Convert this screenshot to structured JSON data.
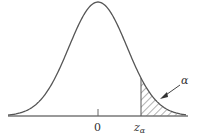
{
  "chart_data": {
    "type": "line",
    "title": "",
    "xlabel": "",
    "ylabel": "",
    "tick_labels": [
      "0",
      "z_α"
    ],
    "annotations": [
      {
        "text": "α",
        "points_to": "shaded right-tail area"
      }
    ],
    "shaded_region": {
      "from": "z_α",
      "to": "+∞",
      "pattern": "diagonal-hatch"
    },
    "grid": false,
    "legend": null
  },
  "labels": {
    "zero": "0",
    "z": "z",
    "z_sub": "α",
    "alpha": "α"
  },
  "colors": {
    "curve": "#555555",
    "axis": "#777777",
    "hatch": "#555555"
  }
}
